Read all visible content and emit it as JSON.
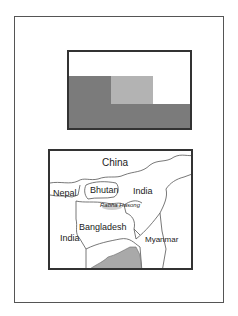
{
  "flag": {
    "colors": {
      "dark": "#7b7b7b",
      "light": "#b3b3b3",
      "white": "#ffffff"
    }
  },
  "map": {
    "labels": {
      "china": "China",
      "nepal": "Nepal",
      "bhutan": "Bhutan",
      "india_east": "India",
      "rabha": "Rabha Hasong",
      "bangladesh": "Bangladesh",
      "india_west": "India",
      "myanmar": "Myanmar"
    }
  }
}
